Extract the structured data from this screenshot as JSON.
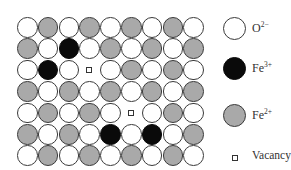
{
  "diagram": {
    "type": "crystal-lattice",
    "grid": {
      "rows": 7,
      "cols": 9
    },
    "colors": {
      "O2-": "#ffffff",
      "Fe3+": "#0a0a0a",
      "Fe2+": "#a9a9a9",
      "outline": "#3a3a3a"
    },
    "lattice": [
      [
        "O2-",
        "Fe2+",
        "O2-",
        "Fe2+",
        "O2-",
        "Fe2+",
        "O2-",
        "Fe2+",
        "O2-"
      ],
      [
        "Fe2+",
        "O2-",
        "Fe3+",
        "O2-",
        "Fe2+",
        "O2-",
        "Fe2+",
        "O2-",
        "Fe2+"
      ],
      [
        "O2-",
        "Fe3+",
        "O2-",
        "vacancy",
        "O2-",
        "Fe2+",
        "O2-",
        "Fe2+",
        "O2-"
      ],
      [
        "Fe2+",
        "O2-",
        "Fe2+",
        "O2-",
        "Fe2+",
        "O2-",
        "Fe2+",
        "O2-",
        "Fe2+"
      ],
      [
        "O2-",
        "Fe2+",
        "O2-",
        "Fe2+",
        "O2-",
        "vacancy",
        "O2-",
        "Fe2+",
        "O2-"
      ],
      [
        "Fe2+",
        "O2-",
        "Fe2+",
        "O2-",
        "Fe3+",
        "O2-",
        "Fe3+",
        "O2-",
        "Fe2+"
      ],
      [
        "O2-",
        "Fe2+",
        "O2-",
        "Fe2+",
        "O2-",
        "Fe2+",
        "O2-",
        "Fe2+",
        "O2-"
      ]
    ]
  },
  "legend": {
    "items": [
      {
        "key": "O2-",
        "base": "O",
        "charge": "2−",
        "symbol": "white-circle"
      },
      {
        "key": "Fe3+",
        "base": "Fe",
        "charge": "3+",
        "symbol": "black-circle"
      },
      {
        "key": "Fe2+",
        "base": "Fe",
        "charge": "2+",
        "symbol": "gray-circle"
      },
      {
        "key": "vacancy",
        "label": "Vacancy",
        "symbol": "small-square"
      }
    ]
  }
}
